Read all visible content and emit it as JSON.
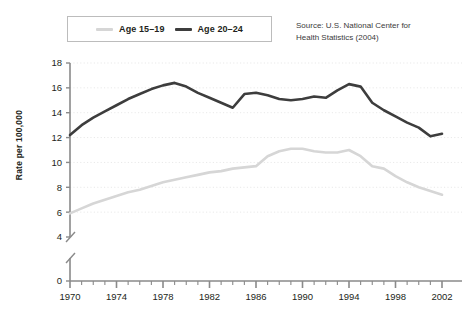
{
  "legend": {
    "entries": [
      {
        "label": "Age 15–19",
        "color": "#d6d6d6",
        "name": "legend-age-15-19"
      },
      {
        "label": "Age 20–24",
        "color": "#3d3d3d",
        "name": "legend-age-20-24"
      }
    ]
  },
  "source": {
    "line1": "Source: U.S. National Center for",
    "line2": "Health Statistics (2004)"
  },
  "chart_data": {
    "type": "line",
    "title": "",
    "xlabel": "",
    "ylabel": "Rate per 100,000",
    "xlim": [
      1970,
      2002
    ],
    "ylim": [
      4,
      18
    ],
    "axis_break": {
      "from": 0,
      "to": 4,
      "note": "y-axis broken between 0 and 4"
    },
    "grid": "horizontal dotted",
    "legend_position": "top-left",
    "yticks": [
      0,
      4,
      6,
      8,
      10,
      12,
      14,
      16,
      18
    ],
    "ytick_labels": [
      "0",
      "4",
      "6",
      "8",
      "10",
      "12",
      "14",
      "16",
      "18"
    ],
    "xticks_major": [
      1970,
      1974,
      1978,
      1982,
      1986,
      1990,
      1994,
      1998,
      2002
    ],
    "xtick_labels": [
      "1970",
      "1974",
      "1978",
      "1982",
      "1986",
      "1990",
      "1994",
      "1998",
      "2002"
    ],
    "xtick_minor_step": 1,
    "x": [
      1970,
      1971,
      1972,
      1973,
      1974,
      1975,
      1976,
      1977,
      1978,
      1979,
      1980,
      1981,
      1982,
      1983,
      1984,
      1985,
      1986,
      1987,
      1988,
      1989,
      1990,
      1991,
      1992,
      1993,
      1994,
      1995,
      1996,
      1997,
      1998,
      1999,
      2000,
      2001,
      2002
    ],
    "series": [
      {
        "name": "Age 20–24",
        "color": "#3d3d3d",
        "values": [
          12.2,
          13.0,
          13.6,
          14.1,
          14.6,
          15.1,
          15.5,
          15.9,
          16.2,
          16.4,
          16.1,
          15.6,
          15.2,
          14.8,
          14.4,
          15.5,
          15.6,
          15.4,
          15.1,
          15.0,
          15.1,
          15.3,
          15.2,
          15.8,
          16.3,
          16.1,
          14.8,
          14.2,
          13.7,
          13.2,
          12.8,
          12.1,
          12.3
        ]
      },
      {
        "name": "Age 15–19",
        "color": "#d6d6d6",
        "values": [
          5.9,
          6.3,
          6.7,
          7.0,
          7.3,
          7.6,
          7.8,
          8.1,
          8.4,
          8.6,
          8.8,
          9.0,
          9.2,
          9.3,
          9.5,
          9.6,
          9.7,
          10.5,
          10.9,
          11.1,
          11.1,
          10.9,
          10.8,
          10.8,
          11.0,
          10.5,
          9.7,
          9.5,
          8.9,
          8.4,
          8.0,
          7.7,
          7.4
        ]
      }
    ]
  }
}
